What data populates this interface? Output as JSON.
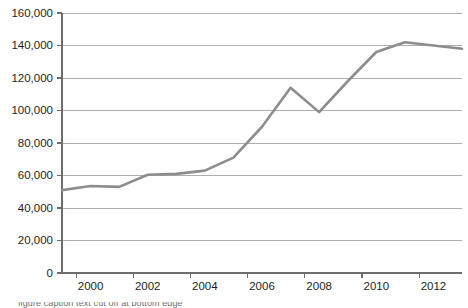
{
  "chart_data": {
    "type": "line",
    "title": "",
    "subtitle": "",
    "xlabel": "",
    "ylabel": "",
    "grid": true,
    "legend": false,
    "legend_position": "none",
    "line_color": "#8d8d8d",
    "axis_color": "#6d6d6d",
    "gridline_color": "#9a9a9a",
    "background_color": "#ffffff",
    "ylim": [
      0,
      160000
    ],
    "ytick_step": 20000,
    "ytick_labels": [
      "160,000",
      "140,000",
      "120,000",
      "100,000",
      "80,000",
      "60,000",
      "40,000",
      "20,000",
      "0"
    ],
    "ytick_values": [
      160000,
      140000,
      120000,
      100000,
      80000,
      60000,
      40000,
      20000,
      0
    ],
    "xtick_labels": [
      "2000",
      "2002",
      "2004",
      "2006",
      "2008",
      "2010",
      "2012"
    ],
    "xtick_values": [
      2000,
      2002,
      2004,
      2006,
      2008,
      2010,
      2012
    ],
    "xlim": [
      1999,
      2013
    ],
    "x": [
      1999,
      2000,
      2001,
      2002,
      2003,
      2004,
      2005,
      2006,
      2007,
      2008,
      2009,
      2010,
      2011,
      2012,
      2013
    ],
    "values": [
      51000,
      53500,
      53000,
      60500,
      61000,
      63000,
      71000,
      90000,
      114000,
      99000,
      118000,
      136000,
      142000,
      140000,
      138000
    ],
    "series": [
      {
        "name": "Series 1",
        "color": "#8d8d8d",
        "values": [
          51000,
          53500,
          53000,
          60500,
          61000,
          63000,
          71000,
          90000,
          114000,
          99000,
          118000,
          136000,
          142000,
          140000,
          138000
        ]
      }
    ],
    "annotations": []
  },
  "caption": {
    "text": "figure caption text cut off at bottom edge"
  }
}
